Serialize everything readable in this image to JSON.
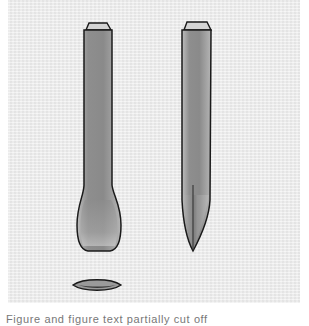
{
  "figure": {
    "colors": {
      "background": "#ececec",
      "outline": "#1a1a1a",
      "fill_dark": "#8a8a8a",
      "fill_light": "#c8c8c8"
    },
    "objects": [
      {
        "name": "rounded-end-tool"
      },
      {
        "name": "pointed-end-tool"
      },
      {
        "name": "cross-section"
      }
    ],
    "caption": "Figure and figure text partially cut off"
  }
}
